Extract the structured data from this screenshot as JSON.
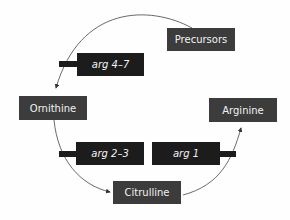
{
  "diagram": {
    "metabolites": [
      {
        "id": "precursors",
        "label": "Precursors"
      },
      {
        "id": "ornithine",
        "label": "Ornithine"
      },
      {
        "id": "citrulline",
        "label": "Citrulline"
      },
      {
        "id": "arginine",
        "label": "Arginine"
      }
    ],
    "genes": [
      {
        "id": "arg47",
        "label": "arg 4–7"
      },
      {
        "id": "arg23",
        "label": "arg  2–3"
      },
      {
        "id": "arg1",
        "label": "arg 1"
      }
    ],
    "colors": {
      "metabolite_box": "#3c3c3c",
      "gene_box": "#1c1c1c",
      "text": "#f2f2f2",
      "arrow": "#333333"
    }
  }
}
